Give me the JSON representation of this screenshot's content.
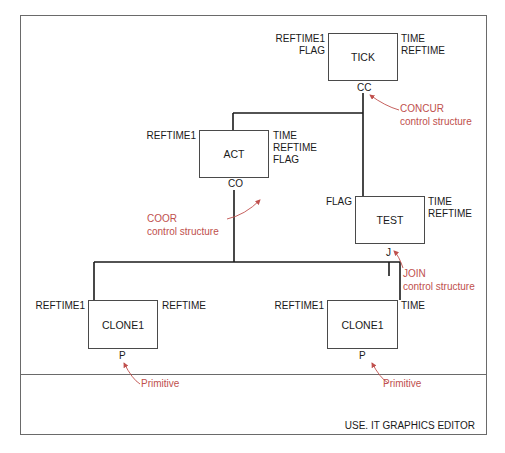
{
  "editor": {
    "status_label": "USE. IT GRAPHICS EDITOR"
  },
  "colors": {
    "annotation": "#c0504d",
    "line": "#1a1a1a",
    "frame": "#6a6a6a"
  },
  "nodes": {
    "tick": {
      "name": "TICK",
      "left_inputs": "REFTIME1\nFLAG",
      "right_outputs": "TIME\nREFTIME",
      "control": "CC"
    },
    "act": {
      "name": "ACT",
      "left_inputs": "REFTIME1",
      "right_outputs": "TIME\nREFTIME\nFLAG",
      "control": "CO"
    },
    "test": {
      "name": "TEST",
      "left_inputs": "FLAG",
      "right_outputs": "TIME\nREFTIME",
      "control": "J"
    },
    "clone_left": {
      "name": "CLONE1",
      "left_inputs": "REFTIME1",
      "right_outputs": "REFTIME",
      "control": "P"
    },
    "clone_right": {
      "name": "CLONE1",
      "left_inputs": "REFTIME1",
      "right_outputs": "TIME",
      "control": "P"
    }
  },
  "annotations": {
    "concur": "CONCUR\ncontrol structure",
    "coor": "COOR\ncontrol structure",
    "join": "JOIN\ncontrol structure",
    "primitive_left": "Primitive",
    "primitive_right": "Primitive"
  }
}
